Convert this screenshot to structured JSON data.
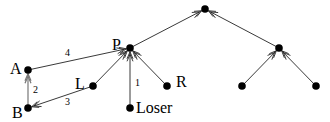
{
  "diagram": {
    "nodes": [
      {
        "id": "A",
        "x": 28,
        "y": 70,
        "label": "A",
        "lx": 10,
        "ly": 74
      },
      {
        "id": "B",
        "x": 28,
        "y": 108,
        "label": "B",
        "lx": 12,
        "ly": 118
      },
      {
        "id": "L",
        "x": 93,
        "y": 86,
        "label": "L",
        "lx": 75,
        "ly": 89
      },
      {
        "id": "P",
        "x": 130,
        "y": 48,
        "label": "P",
        "lx": 112,
        "ly": 50
      },
      {
        "id": "Loser",
        "x": 130,
        "y": 108,
        "label": "Loser",
        "lx": 136,
        "ly": 113
      },
      {
        "id": "R",
        "x": 167,
        "y": 86,
        "label": "R",
        "lx": 176,
        "ly": 87
      },
      {
        "id": "root",
        "x": 205,
        "y": 9,
        "label": ""
      },
      {
        "id": "N2",
        "x": 279,
        "y": 48,
        "label": ""
      },
      {
        "id": "N3",
        "x": 242,
        "y": 86,
        "label": ""
      },
      {
        "id": "N4",
        "x": 316,
        "y": 86,
        "label": ""
      }
    ],
    "edges": [
      {
        "from": "A",
        "to": "P",
        "label": "4",
        "lx": 65,
        "ly": 56
      },
      {
        "from": "B",
        "to": "A",
        "label": "2",
        "lx": 33,
        "ly": 93,
        "gray": true
      },
      {
        "from": "L",
        "to": "B",
        "label": "3",
        "lx": 65,
        "ly": 105
      },
      {
        "from": "Loser",
        "to": "P",
        "label": "1",
        "lx": 135,
        "ly": 86
      },
      {
        "from": "L",
        "to": "P",
        "label": ""
      },
      {
        "from": "R",
        "to": "P",
        "label": ""
      },
      {
        "from": "P",
        "to": "root",
        "label": ""
      },
      {
        "from": "N2",
        "to": "root",
        "label": ""
      },
      {
        "from": "N3",
        "to": "N2",
        "label": ""
      },
      {
        "from": "N4",
        "to": "N2",
        "label": ""
      }
    ]
  }
}
